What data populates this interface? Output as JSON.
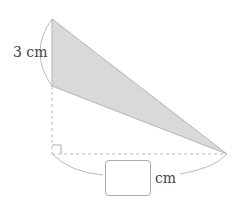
{
  "diagram": {
    "height_label": "3 cm",
    "base_unit": "cm",
    "answer_box": "",
    "colors": {
      "fill": "#d9d9d9",
      "stroke": "#b0b0b0",
      "text": "#444444"
    }
  }
}
